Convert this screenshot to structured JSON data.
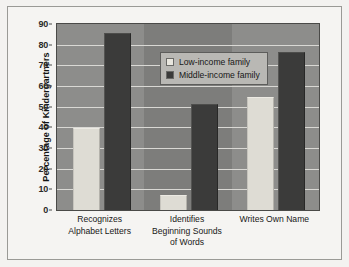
{
  "chart_data": {
    "type": "bar",
    "title": "",
    "subtitle": "",
    "xlabel": "",
    "ylabel": "Percentage of Kindergartners",
    "ylim": [
      0,
      90
    ],
    "ytick_step": 10,
    "yticks": [
      "0",
      "10",
      "20",
      "30",
      "40",
      "50",
      "60",
      "70",
      "80",
      "90"
    ],
    "grid": true,
    "legend_position": "upper center",
    "categories": [
      "Recognizes\nAlphabet Letters",
      "Identifies\nBeginning Sounds\nof Words",
      "Writes Own Name"
    ],
    "series": [
      {
        "name": "Low-income family",
        "color": "#dedcd4",
        "values": [
          39,
          7,
          54
        ]
      },
      {
        "name": "Middle-income family",
        "color": "#3b3b3a",
        "values": [
          85,
          51,
          76
        ]
      }
    ],
    "annotations": []
  },
  "legend": {
    "items": [
      {
        "label": "Low-income family",
        "swatch": "low-income-swatch"
      },
      {
        "label": "Middle-income family",
        "swatch": "middle-income-swatch"
      }
    ]
  }
}
